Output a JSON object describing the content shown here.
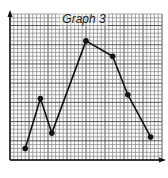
{
  "chart_data": {
    "type": "line",
    "title": "Graph 3",
    "xlabel": "",
    "ylabel": "",
    "grid": true,
    "axis_arrows": true,
    "tick_labels": false,
    "x": [
      4,
      8,
      11,
      20,
      27,
      31,
      37
    ],
    "values": [
      3,
      16,
      7,
      31,
      27,
      17,
      6
    ],
    "xlim": [
      0,
      40
    ],
    "ylim": [
      0,
      38
    ],
    "minor_per_major": 5,
    "markers": true
  },
  "colors": {
    "line": "#111111",
    "grid_minor": "#8c8c8c",
    "grid_major": "#555555",
    "background": "#ffffff"
  }
}
